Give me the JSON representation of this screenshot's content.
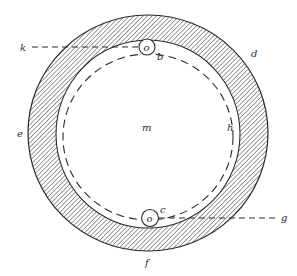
{
  "diagram": {
    "type": "cross-section",
    "colors": {
      "background": "#ffffff",
      "stroke": "#2a2a2a",
      "hatch": "#3a3a3a"
    },
    "labels": {
      "k": "k",
      "o_top": "o",
      "b": "b",
      "d": "d",
      "e": "e",
      "m": "m",
      "h": "h",
      "o_bottom": "o",
      "c": "c",
      "g": "g",
      "f": "f"
    }
  }
}
